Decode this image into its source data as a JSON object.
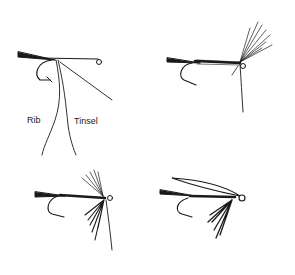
{
  "diagram": {
    "panels": [
      {
        "id": "step-1",
        "labels": [
          "Rib",
          "Tinsel"
        ]
      },
      {
        "id": "step-2",
        "labels": []
      },
      {
        "id": "step-3",
        "labels": []
      },
      {
        "id": "step-4",
        "labels": []
      }
    ],
    "colors": {
      "ink": "#1a1a1a",
      "background": "#ffffff"
    }
  }
}
